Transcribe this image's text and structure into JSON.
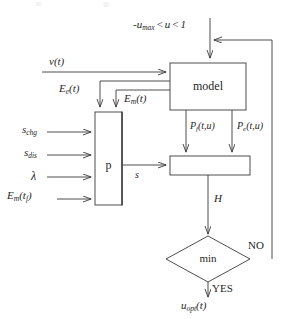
{
  "figure": {
    "type": "block-diagram",
    "background_color": "#ffffff",
    "line_color": "#3a3a3a"
  },
  "constraint": {
    "prefix": "-",
    "var_base": "u",
    "var_sub": "max",
    "rel1": "<",
    "u": "u",
    "rel2": "<",
    "upper": "1"
  },
  "blocks": {
    "model": {
      "label": "model"
    },
    "p": {
      "label": "p"
    },
    "sum": {
      "label": ""
    },
    "decision": {
      "label": "min"
    }
  },
  "signals": {
    "velocity": {
      "base": "v",
      "arg": "(t)"
    },
    "e_elec": {
      "base": "E",
      "sub": "e",
      "arg": "(t)"
    },
    "e_mech": {
      "base": "E",
      "sub": "m",
      "arg": "(t)"
    },
    "s_chg": {
      "base": "s",
      "sub": "chg"
    },
    "s_dis": {
      "base": "s",
      "sub": "dis"
    },
    "lambda": {
      "glyph": "λ"
    },
    "e_mech_tf": {
      "base": "E",
      "sub": "m",
      "arg_open": "(t",
      "arg_sub": "f",
      "arg_close": ")"
    },
    "s": {
      "base": "s"
    },
    "p_f": {
      "base": "P",
      "sub": "f",
      "arg": "(t,u)"
    },
    "p_e": {
      "base": "P",
      "sub": "e",
      "arg": "(t,u)"
    },
    "H": {
      "base": "H"
    },
    "u_opt": {
      "base": "u",
      "sub": "opt",
      "arg": "(t)"
    }
  },
  "decision_labels": {
    "no": "NO",
    "yes": "YES"
  }
}
